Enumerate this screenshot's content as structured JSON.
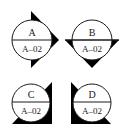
{
  "diagram": {
    "type": "section-elevation-markers",
    "colors": {
      "stroke": "#1a1a1a",
      "fill_arrow": "#000000",
      "background": "#ffffff"
    },
    "markers": [
      {
        "id": "A",
        "label": "A",
        "sheet": "A–02",
        "arrow": "right-pointing triangle"
      },
      {
        "id": "B",
        "label": "B",
        "sheet": "A–02",
        "arrow": "down-pointing triangle"
      },
      {
        "id": "C",
        "label": "C",
        "sheet": "A–02",
        "arrow": "right-angle corner bottom-right"
      },
      {
        "id": "D",
        "label": "D",
        "sheet": "A–02",
        "arrow": "right-angle corner bottom-left"
      }
    ]
  }
}
